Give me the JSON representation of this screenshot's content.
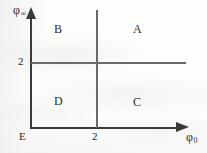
{
  "figure": {
    "type": "quadrant-diagram",
    "background_color": "#fdfdfc",
    "line_color": "#3a3a3a",
    "divider_color": "#6a6a6a"
  },
  "axes": {
    "y": {
      "symbol": "φ",
      "subscript": "∞",
      "title": "φ∞",
      "arrow": "up-arrow-icon"
    },
    "x": {
      "symbol": "φ",
      "subscript": "0",
      "title": "φ0",
      "arrow": "right-arrow-icon"
    },
    "origin_label": "E"
  },
  "ticks": {
    "y": [
      {
        "value": "2"
      }
    ],
    "x": [
      {
        "value": "2"
      }
    ]
  },
  "regions": [
    {
      "id": "b",
      "label": "B",
      "position": "top-left"
    },
    {
      "id": "a",
      "label": "A",
      "position": "top-right"
    },
    {
      "id": "d",
      "label": "D",
      "position": "bottom-left"
    },
    {
      "id": "c",
      "label": "C",
      "position": "bottom-right"
    }
  ],
  "chart_data": {
    "type": "scatter",
    "title": "",
    "xlabel": "φ0",
    "ylabel": "φ∞",
    "xlim": [
      0,
      4.6
    ],
    "ylim": [
      0,
      3.6
    ],
    "grid": false,
    "legend": "none",
    "annotations": [
      {
        "text": "B",
        "x": 0.8,
        "y": 2.95,
        "note": "region label, upper-left quadrant"
      },
      {
        "text": "A",
        "x": 3.2,
        "y": 2.95,
        "note": "region label, upper-right quadrant"
      },
      {
        "text": "D",
        "x": 0.8,
        "y": 0.95,
        "note": "region label, lower-left quadrant"
      },
      {
        "text": "C",
        "x": 3.2,
        "y": 0.95,
        "note": "region label, lower-right quadrant"
      },
      {
        "text": "E",
        "x": 0.0,
        "y": 0.0,
        "note": "origin label"
      }
    ],
    "reference_lines": [
      {
        "orientation": "horizontal",
        "value": 2,
        "label": "2",
        "axis": "φ∞"
      },
      {
        "orientation": "vertical",
        "value": 2,
        "label": "2",
        "axis": "φ0"
      }
    ],
    "xticks": [
      2
    ],
    "xticklabels": [
      "2"
    ],
    "yticks": [
      2
    ],
    "yticklabels": [
      "2"
    ]
  }
}
